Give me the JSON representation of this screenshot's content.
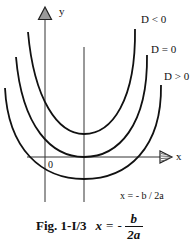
{
  "figure": {
    "caption": {
      "number": "Fig. 1-I/3",
      "lhs": "x",
      "equals": "=",
      "minus": "-",
      "numerator": "b",
      "denominator": "2a"
    },
    "axes": {
      "x_label": "x",
      "y_label": "y",
      "origin_label": "0"
    },
    "symmetry_line": {
      "label": "x = - b / 2a"
    },
    "curves": [
      {
        "label": "D < 0",
        "vertex_relative_to_x_axis": "above"
      },
      {
        "label": "D = 0",
        "vertex_relative_to_x_axis": "tangent"
      },
      {
        "label": "D > 0",
        "vertex_relative_to_x_axis": "below"
      }
    ],
    "colors": {
      "line": "#111111",
      "arrow_fill": "#9a9a9a",
      "background": "#ffffff"
    }
  }
}
